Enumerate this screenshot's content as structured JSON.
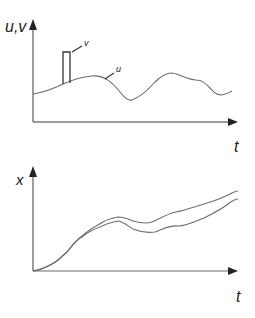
{
  "top_plot": {
    "y_axis_label": "u,v",
    "x_axis_label": "t",
    "curve_labels": {
      "v": "v",
      "u": "u"
    },
    "curves": {
      "u": "M33,94 C45,92 55,88 63,84 C72,80 80,77 92,76 C104,75 112,82 120,92 C125,98 128,101 132,100 C140,97 148,90 155,82 C161,76 166,73 172,73 C180,74 186,79 196,80 C202,80 205,83 210,88 C214,92 216,95 222,95 C227,94 230,92 232,91",
      "v_pulse": "M63,84 L63,52 L70,52 L70,83"
    }
  },
  "bottom_plot": {
    "y_axis_label": "x",
    "x_axis_label": "t",
    "curves": {
      "x1": "M33,271 C40,270 45,268 52,264 C58,261 62,256 67,252 C72,246 76,240 82,236 C88,231 92,228 98,225 C104,221 110,218 118,217 C124,217 128,219 133,221 C140,223 146,224 152,222 C160,219 166,214 176,212 C186,210 194,207 204,204 C214,201 222,198 228,195 C232,193 235,191 238,191",
      "x2": "M33,271 C40,270 45,268 52,264 C58,261 62,256 67,252 C72,246 76,240 82,237 C88,232 94,229 100,227 C106,224 112,222 118,221 C124,222 128,226 133,229 C140,232 147,233 155,232 C162,230 168,225 178,226 C186,226 194,222 204,218 C214,213 222,209 228,204 C232,201 235,199 238,199"
    }
  },
  "colors": {
    "axis": "#3a3a3a",
    "curve": "#6e6e6e",
    "label": "#222222"
  }
}
